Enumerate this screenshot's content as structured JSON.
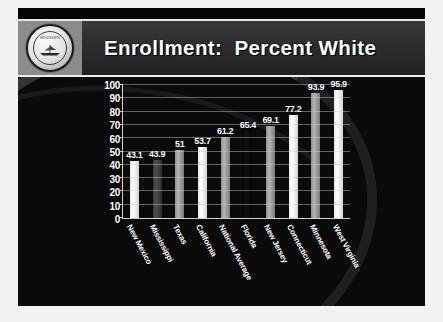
{
  "slide": {
    "title": "Enrollment:  Percent White",
    "logo": {
      "name": "institutional-seal",
      "top_text": "MISSISSIPPI",
      "center_text": "Delta State University",
      "bottom_text": "FOUNDED 1924"
    }
  },
  "chart_data": {
    "type": "bar",
    "title": "Enrollment:  Percent White",
    "xlabel": "",
    "ylabel": "",
    "ylim": [
      0,
      100
    ],
    "yticks": [
      0,
      10,
      20,
      30,
      40,
      50,
      60,
      70,
      80,
      90,
      100
    ],
    "grid": true,
    "legend": "none",
    "value_labels": true,
    "categories": [
      "New Mexico",
      "Mississippi",
      "Texas",
      "California",
      "National Average",
      "Florida",
      "New Jersey",
      "Connecticut",
      "Minnesota",
      "West Virginia"
    ],
    "values": [
      43.1,
      43.9,
      51,
      53.7,
      61.2,
      65.4,
      69.1,
      77.2,
      93.9,
      95.9
    ],
    "value_label_text": [
      "43.1",
      "43.9",
      "51",
      "53.7",
      "61.2",
      "65.4",
      "69.1",
      "77.2",
      "93.9",
      "95.9"
    ],
    "bar_styles": [
      "light",
      "dark",
      "mid",
      "light",
      "mid",
      "black",
      "mid",
      "light",
      "mid",
      "light"
    ],
    "highlight_index": 5,
    "highlight_note": "National Average bar rendered in black"
  },
  "colors": {
    "slide_background": "#f2f2f2",
    "header_band": "#2a2a2a",
    "chart_background": "#0a0a0a",
    "title_text": "#ffffff",
    "axis": "#cfcfcf",
    "gridline": "#cdcdcd",
    "bar_light": "#ffffff",
    "bar_mid": "#b4b4b4",
    "bar_dark": "#4e4e4e",
    "bar_black": "#060606"
  }
}
